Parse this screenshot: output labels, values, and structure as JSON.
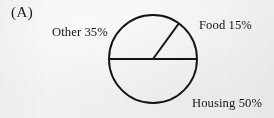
{
  "figure": {
    "panel_letter": "(A)",
    "background_color": "#f3f2f0",
    "stroke_color": "#141414",
    "text_color": "#141414"
  },
  "chart_data": {
    "type": "pie",
    "title": "",
    "subtitle": "",
    "xlabel": "",
    "ylabel": "",
    "categories": [
      "Housing",
      "Other",
      "Food"
    ],
    "values": [
      50,
      35,
      15
    ],
    "value_unit": "%",
    "labels": [
      "Housing 50%",
      "Other 35%",
      "Food 15%"
    ],
    "slices": [
      {
        "name": "Housing",
        "value": 50,
        "label": "Housing 50%",
        "start_angle_deg": 180,
        "end_angle_deg": 360,
        "fill": "none",
        "stroke": "#141414"
      },
      {
        "name": "Other",
        "value": 35,
        "label": "Other 35%",
        "start_angle_deg": 54,
        "end_angle_deg": 180,
        "fill": "none",
        "stroke": "#141414"
      },
      {
        "name": "Food",
        "value": 15,
        "label": "Food 15%",
        "start_angle_deg": 0,
        "end_angle_deg": 54,
        "fill": "none",
        "stroke": "#141414"
      }
    ],
    "geometry": {
      "center_x": 153,
      "center_y": 59,
      "radius": 44,
      "stroke_width": 1.9
    },
    "legend": "none",
    "grid": false,
    "start_angle_note": "0 deg at 3 o'clock, measured counter-clockwise"
  },
  "labels": {
    "other": "Other 35%",
    "food": "Food 15%",
    "housing": "Housing 50%"
  }
}
